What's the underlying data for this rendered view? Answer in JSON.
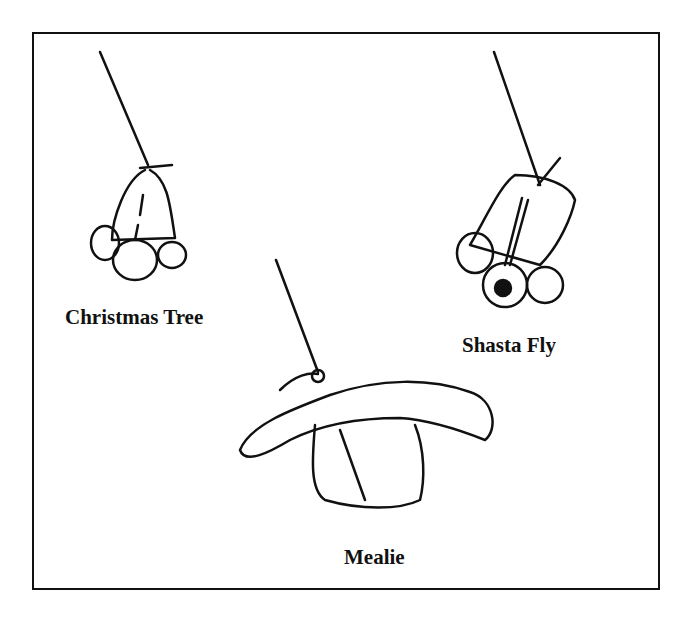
{
  "figure": {
    "items": [
      {
        "label": "Christmas Tree",
        "icon": "christmas-tree-fly-drawing"
      },
      {
        "label": "Shasta Fly",
        "icon": "shasta-fly-drawing"
      },
      {
        "label": "Mealie",
        "icon": "mealie-fly-drawing"
      }
    ]
  }
}
